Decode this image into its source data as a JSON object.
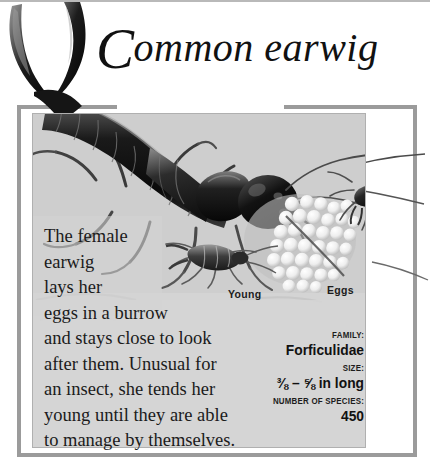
{
  "page": {
    "title_dropcap": "C",
    "title_rest": "ommon earwig",
    "title_full": "Common earwig"
  },
  "body": {
    "paragraph_lines": [
      "The female",
      "earwig",
      "lays her",
      "eggs in a burrow",
      "and stays close to look",
      "after them. Unusual for",
      "an insect, she tends her",
      "young until they are able",
      "to manage by themselves."
    ],
    "paragraph_text": "The female earwig lays her eggs in a burrow and stays close to look after them. Unusual for an insect, she tends her young until they are able to manage by themselves."
  },
  "picture_labels": {
    "young": "Young",
    "eggs": "Eggs"
  },
  "facts": [
    {
      "key": "FAMILY:",
      "value": "Forficulidae"
    },
    {
      "key": "SIZE:",
      "value": "⅜ – ⅝ in long"
    },
    {
      "key": "NUMBER OF SPECIES:",
      "value": "450"
    }
  ],
  "colors": {
    "panel_background": "#d4d4d4",
    "frame": "#9b9b9b",
    "text": "#1b1b1b",
    "page_background": "#ffffff"
  }
}
